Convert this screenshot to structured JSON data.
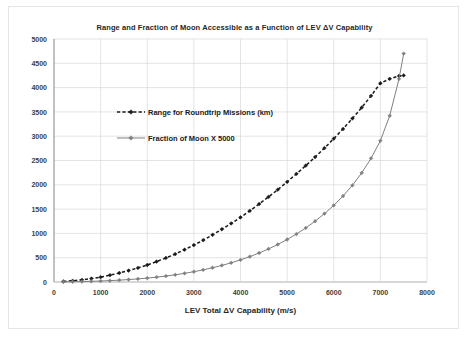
{
  "chart_data": {
    "type": "line",
    "title": "Range and Fraction of Moon Accessible as a Function of LEV ΔV Capability",
    "xlabel": "LEV Total ΔV Capability (m/s)",
    "ylabel": "",
    "xlim": [
      0,
      8000
    ],
    "ylim": [
      0,
      5000
    ],
    "xticks": [
      "0",
      "1000",
      "2000",
      "3000",
      "4000",
      "5000",
      "6000",
      "7000",
      "8000"
    ],
    "yticks": [
      "0",
      "500",
      "1000",
      "1500",
      "2000",
      "2500",
      "3000",
      "3500",
      "4000",
      "4500",
      "5000"
    ],
    "grid": true,
    "legend_position": "upper-left-inside",
    "series": [
      {
        "name": "Range for Roundtrip Missions (km)",
        "color": "#1a1a1a",
        "line_style": "dashed",
        "marker": "diamond",
        "x": [
          200,
          400,
          600,
          800,
          1000,
          1200,
          1400,
          1600,
          1800,
          2000,
          2200,
          2400,
          2600,
          2800,
          3000,
          3200,
          3400,
          3600,
          3800,
          4000,
          4200,
          4400,
          4600,
          4800,
          5000,
          5200,
          5400,
          5600,
          5800,
          6000,
          6200,
          6400,
          6600,
          6800,
          7000,
          7200,
          7400,
          7500
        ],
        "y": [
          10,
          25,
          45,
          70,
          100,
          140,
          185,
          235,
          290,
          350,
          420,
          495,
          575,
          665,
          760,
          860,
          970,
          1085,
          1205,
          1330,
          1465,
          1605,
          1750,
          1900,
          2060,
          2225,
          2395,
          2570,
          2755,
          2950,
          3150,
          3365,
          3590,
          3830,
          4090,
          4180,
          4240,
          4250
        ]
      },
      {
        "name": "Fraction of Moon X 5000",
        "color": "#808080",
        "line_style": "solid",
        "marker": "diamond",
        "x": [
          200,
          400,
          600,
          800,
          1000,
          1200,
          1400,
          1600,
          1800,
          2000,
          2200,
          2400,
          2600,
          2800,
          3000,
          3200,
          3400,
          3600,
          3800,
          4000,
          4200,
          4400,
          4600,
          4800,
          5000,
          5200,
          5400,
          5600,
          5800,
          6000,
          6200,
          6400,
          6600,
          6800,
          7000,
          7200,
          7400,
          7500
        ],
        "y": [
          2,
          5,
          9,
          14,
          20,
          28,
          38,
          50,
          64,
          80,
          100,
          122,
          148,
          178,
          212,
          250,
          293,
          341,
          395,
          455,
          522,
          597,
          680,
          772,
          874,
          987,
          1112,
          1251,
          1405,
          1577,
          1770,
          1990,
          2245,
          2545,
          2905,
          3420,
          4180,
          4700
        ]
      }
    ]
  }
}
